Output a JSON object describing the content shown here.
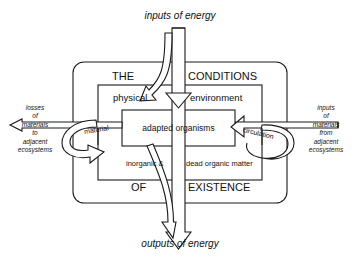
{
  "diagram": {
    "title_top": "inputs of energy",
    "title_bottom": "outputs of energy",
    "outer_box": {
      "label_left": "THE",
      "label_right": "CONDITIONS",
      "label_bottom_left": "OF",
      "label_bottom_right": "EXISTENCE"
    },
    "inner_box": {
      "label_left": "physical",
      "label_right": "environment",
      "label_bottom_left": "inorganic &",
      "label_bottom_right": "dead organic matter"
    },
    "core_box": {
      "label": "adapted organisms"
    },
    "left_flow": {
      "loop_label": "material",
      "caption_lines": [
        "losses",
        "of",
        "materials",
        "to",
        "adjacent",
        "ecosystems"
      ]
    },
    "right_flow": {
      "loop_label": "circulation",
      "caption_lines": [
        "inputs",
        "of",
        "materials",
        "from",
        "adjacent",
        "ecosystems"
      ]
    },
    "colors": {
      "stroke": "#1a1a1a",
      "background": "#ffffff",
      "fill": "#ffffff"
    }
  }
}
